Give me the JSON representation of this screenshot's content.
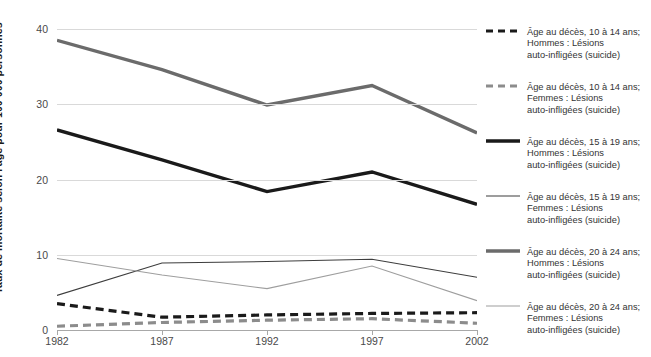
{
  "chart_data": {
    "type": "line",
    "title": "",
    "subtitle": "",
    "xlabel": "",
    "ylabel": "Taux de mortalité selon l'âge pour 100 000 personnes",
    "x": [
      1982,
      1987,
      1992,
      1997,
      2002
    ],
    "xtick_labels": [
      "1982",
      "1987",
      "1992",
      "1997",
      "2002"
    ],
    "ytick_labels": [
      "0",
      "10",
      "20",
      "30",
      "40"
    ],
    "yticks": [
      0,
      10,
      20,
      30,
      40
    ],
    "ylim": [
      0,
      42
    ],
    "xlim": [
      1982,
      2002
    ],
    "grid": true,
    "legend_position": "right",
    "series": [
      {
        "name": "Âge au décès, 10 à 14 ans;\nHommes : Lésions\nauto-infligées (suicide)",
        "key": "hommes-10-14",
        "values": [
          3.5,
          1.7,
          2.0,
          2.2,
          2.3
        ],
        "color": "#1a1a1a",
        "width": 3.2,
        "dash": "8,5"
      },
      {
        "name": "Âge au décès, 10 à 14 ans;\nFemmes : Lésions\nauto-infligées (suicide)",
        "key": "femmes-10-14",
        "values": [
          0.5,
          1.0,
          1.3,
          1.5,
          0.9
        ],
        "color": "#8c8c8c",
        "width": 3.2,
        "dash": "8,5"
      },
      {
        "name": "Âge au décès, 15 à 19 ans;\nHommes : Lésions\nauto-infligées (suicide)",
        "key": "hommes-15-19",
        "values": [
          26.6,
          22.6,
          18.4,
          21.0,
          16.7
        ],
        "color": "#1a1a1a",
        "width": 3.4,
        "dash": ""
      },
      {
        "name": "Âge au décès, 15 à 19 ans;\nFemmes : Lésions\nauto-infligées (suicide)",
        "key": "femmes-15-19",
        "values": [
          4.6,
          8.9,
          9.1,
          9.4,
          7.0
        ],
        "color": "#3d3d3d",
        "width": 1.1,
        "dash": ""
      },
      {
        "name": "Âge au décès, 20 à 24 ans;\nHommes : Lésions\nauto-infligées (suicide)",
        "key": "hommes-20-24",
        "values": [
          38.5,
          34.6,
          29.9,
          32.5,
          26.2
        ],
        "color": "#6b6b6b",
        "width": 3.4,
        "dash": ""
      },
      {
        "name": "Âge au décès, 20 à 24 ans;\nFemmes : Lésions\nauto-infligées (suicide)",
        "key": "femmes-20-24",
        "values": [
          9.5,
          7.3,
          5.5,
          8.5,
          3.9
        ],
        "color": "#9e9e9e",
        "width": 1.1,
        "dash": ""
      }
    ]
  },
  "axis": {
    "y_title": "Taux de mortalité selon l'âge pour 100 000 personnes"
  }
}
